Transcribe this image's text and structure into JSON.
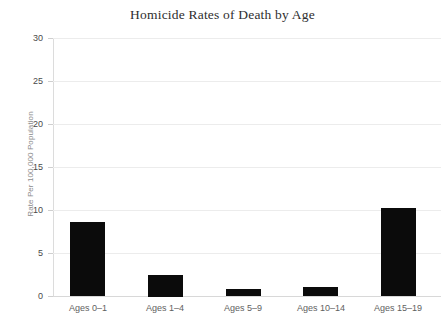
{
  "chart_data": {
    "type": "bar",
    "title": "Homicide Rates of Death by Age",
    "xlabel": "",
    "ylabel": "Rate Per 100,000 Population",
    "categories": [
      "Ages 0–1",
      "Ages 1–4",
      "Ages 5–9",
      "Ages 10–14",
      "Ages 15–19"
    ],
    "values": [
      8.6,
      2.5,
      0.8,
      1.1,
      10.2
    ],
    "ylim": [
      0,
      30
    ],
    "yticks": [
      0,
      5,
      10,
      15,
      20,
      25,
      30
    ],
    "ytick_labels": [
      "0",
      "5",
      "10",
      "15",
      "20",
      "25",
      "30"
    ],
    "grid": true,
    "legend": "none",
    "bar_color": "#0b0b0b",
    "grid_color": "#ececec",
    "background_color": "#ffffff"
  }
}
